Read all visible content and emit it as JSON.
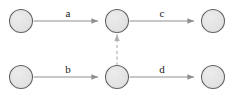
{
  "diagram": {
    "type": "directed-graph",
    "width": 234,
    "height": 99,
    "background": "#ffffff",
    "style": {
      "node_fill": "#e3e3e3",
      "node_stroke": "#646464",
      "edge_stroke": "#8f8f8f",
      "dashed_edge_stroke": "#b0b0b0",
      "label_color": "#1a1a1a",
      "node_radius": 11.5
    },
    "nodes": [
      {
        "id": "n1",
        "label": "",
        "cx": 21,
        "cy": 21,
        "row": "top",
        "position": "left"
      },
      {
        "id": "n2",
        "label": "",
        "cx": 117,
        "cy": 21,
        "row": "top",
        "position": "center"
      },
      {
        "id": "n3",
        "label": "",
        "cx": 213,
        "cy": 21,
        "row": "top",
        "position": "right"
      },
      {
        "id": "n4",
        "label": "",
        "cx": 21,
        "cy": 77,
        "row": "bottom",
        "position": "left"
      },
      {
        "id": "n5",
        "label": "",
        "cx": 117,
        "cy": 77,
        "row": "bottom",
        "position": "center"
      },
      {
        "id": "n6",
        "label": "",
        "cx": 213,
        "cy": 77,
        "row": "bottom",
        "position": "right"
      }
    ],
    "edges": [
      {
        "id": "e_a",
        "label": "a",
        "from": "n1",
        "to": "n2",
        "style": "solid",
        "direction": "right",
        "label_x": 68,
        "label_y": 14
      },
      {
        "id": "e_c",
        "label": "c",
        "from": "n2",
        "to": "n3",
        "style": "solid",
        "direction": "right",
        "label_x": 162,
        "label_y": 14
      },
      {
        "id": "e_b",
        "label": "b",
        "from": "n4",
        "to": "n5",
        "style": "solid",
        "direction": "right",
        "label_x": 68,
        "label_y": 70
      },
      {
        "id": "e_d",
        "label": "d",
        "from": "n5",
        "to": "n6",
        "style": "solid",
        "direction": "right",
        "label_x": 162,
        "label_y": 70
      },
      {
        "id": "e_dashed",
        "label": "",
        "from": "n5",
        "to": "n2",
        "style": "dashed",
        "direction": "up",
        "label_x": 0,
        "label_y": 0
      }
    ]
  }
}
